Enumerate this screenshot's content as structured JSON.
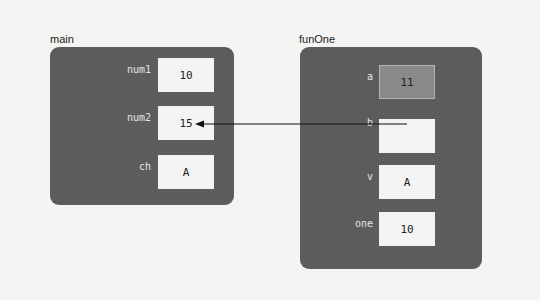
{
  "frames": {
    "main": {
      "title": "main",
      "vars": [
        {
          "name": "num1",
          "value": "10"
        },
        {
          "name": "num2",
          "value": "15"
        },
        {
          "name": "ch",
          "value": "A"
        }
      ]
    },
    "funOne": {
      "title": "funOne",
      "vars": [
        {
          "name": "a",
          "value": "11",
          "highlighted": true
        },
        {
          "name": "b",
          "value": ""
        },
        {
          "name": "v",
          "value": "A"
        },
        {
          "name": "one",
          "value": "10"
        }
      ]
    }
  },
  "arrow": {
    "from": "funOne.b",
    "to": "main.num2",
    "meaning": "reference parameter"
  },
  "colors": {
    "panel": "#5c5c5c",
    "cell": "#f3f3f1",
    "highlight_cell": "#8a8a8a",
    "background": "#f4f4f2"
  }
}
